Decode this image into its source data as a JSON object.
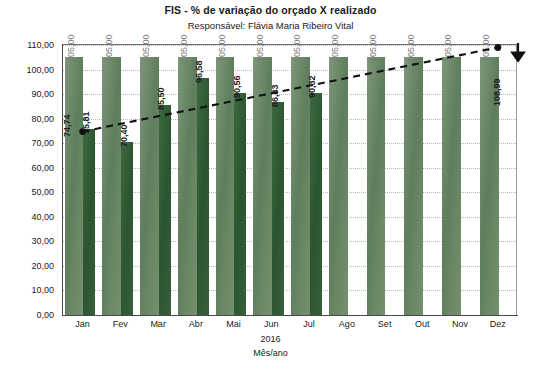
{
  "chart_data": {
    "type": "bar",
    "title": "FIS - % de variação do orçado X realizado",
    "subtitle": "Responsável: Flávia Maria Ribeiro Vital",
    "xlabel": "Mês/ano",
    "xlabel_year": "2016",
    "ylabel": "",
    "ylim": [
      0,
      110
    ],
    "ytick_step": 10,
    "ytick_labels": [
      "0,00",
      "10,00",
      "20,00",
      "30,00",
      "40,00",
      "50,00",
      "60,00",
      "70,00",
      "80,00",
      "90,00",
      "100,00",
      "110,00"
    ],
    "ytick_values": [
      0,
      10,
      20,
      30,
      40,
      50,
      60,
      70,
      80,
      90,
      100,
      110
    ],
    "grid": true,
    "legend": "none",
    "categories": [
      "Jan",
      "Fev",
      "Mar",
      "Abr",
      "Mai",
      "Jun",
      "Jul",
      "Ago",
      "Set",
      "Out",
      "Nov",
      "Dez"
    ],
    "series": [
      {
        "name": "Orçado",
        "color": "#6d8a6a",
        "values": [
          105.0,
          105.0,
          105.0,
          105.0,
          105.0,
          105.0,
          105.0,
          105.0,
          105.0,
          105.0,
          105.0,
          105.0
        ],
        "labels": [
          "105,00",
          "105,00",
          "105,00",
          "105,00",
          "105,00",
          "105,00",
          "105,00",
          "105,00",
          "105,00",
          "105,00",
          "105,00",
          "105,00"
        ]
      },
      {
        "name": "Realizado",
        "color": "#2f5b33",
        "values": [
          75.81,
          70.4,
          85.5,
          96.58,
          90.56,
          86.83,
          90.32,
          null,
          null,
          null,
          null,
          null
        ],
        "labels": [
          "75,81",
          "70,40",
          "85,50",
          "96,58",
          "90,56",
          "86,83",
          "90,32",
          "",
          "",
          "",
          "",
          ""
        ]
      }
    ],
    "trend_line": {
      "name": "Tendência",
      "style": "dashed",
      "color": "#111111",
      "start": {
        "category": "Jan",
        "value": 74.74,
        "label": "74,74"
      },
      "end": {
        "category": "Dez",
        "value": 108.99,
        "label": "108,99"
      },
      "markers": [
        "Jan",
        "Dez"
      ]
    },
    "annotations": [
      {
        "name": "down-arrow",
        "glyph": "arrow-down",
        "near": "Dez",
        "color": "#111111"
      }
    ]
  }
}
